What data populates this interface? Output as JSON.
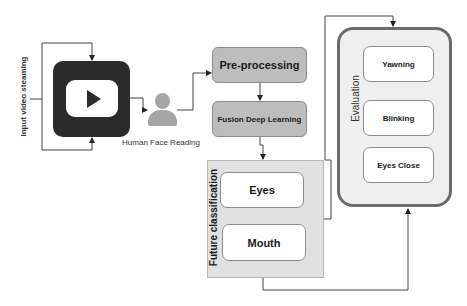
{
  "diagram": {
    "input_label": "Input video steaming",
    "video_source": {
      "icon": "video-play-icon"
    },
    "face_reader": {
      "icon": "person-icon",
      "label": "Human Face Reading"
    },
    "steps": {
      "preprocessing": "Pre-processing",
      "fusion": "Fusion Deep Learning"
    },
    "feature_classification": {
      "title": "Future classification",
      "items": [
        "Eyes",
        "Mouth"
      ]
    },
    "evaluation": {
      "title": "Evaluation",
      "items": [
        "Yawning",
        "Blinking",
        "Eyes Close"
      ]
    },
    "colors": {
      "process_fill": "#bdbdbd",
      "container_fill": "#e0e0e0",
      "evaluation_border": "#6b6b6b",
      "video_icon": "#2b2b2b",
      "person_icon": "#a6a6a6"
    }
  }
}
